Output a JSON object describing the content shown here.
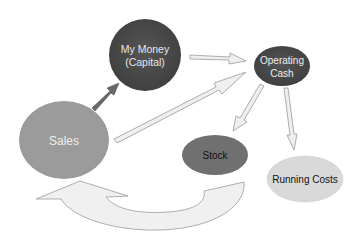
{
  "diagram": {
    "type": "cash-flow-cycle",
    "nodes": [
      {
        "id": "capital",
        "label_line1": "My Money",
        "label_line2": "(Capital)",
        "fill": "#4b4b4b",
        "text_color": "#e8e8e8"
      },
      {
        "id": "operating_cash",
        "label_line1": "Operating",
        "label_line2": "Cash",
        "fill": "#4a4a4a",
        "text_color": "#ececec"
      },
      {
        "id": "sales",
        "label": "Sales",
        "fill": "#9b9b9b",
        "text_color": "#eeeeee"
      },
      {
        "id": "stock",
        "label": "Stock",
        "fill": "#707070",
        "text_color": "#111111"
      },
      {
        "id": "running_costs",
        "label": "Running Costs",
        "fill": "#d9d9d9",
        "text_color": "#111111"
      }
    ],
    "edges": [
      {
        "from": "sales",
        "to": "capital",
        "style": "solid-dark",
        "color": "#666666"
      },
      {
        "from": "capital",
        "to": "operating_cash",
        "style": "hollow",
        "color": "#eeeeee"
      },
      {
        "from": "sales",
        "to": "operating_cash",
        "style": "hollow",
        "color": "#eeeeee"
      },
      {
        "from": "operating_cash",
        "to": "stock",
        "style": "hollow",
        "color": "#eeeeee"
      },
      {
        "from": "operating_cash",
        "to": "running_costs",
        "style": "hollow",
        "color": "#eeeeee"
      },
      {
        "from": "stock",
        "to": "sales",
        "style": "curved-block",
        "color": "#efefef"
      }
    ]
  }
}
